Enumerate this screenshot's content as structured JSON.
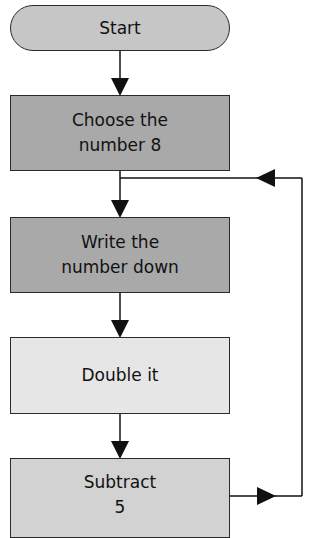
{
  "flowchart": {
    "nodes": [
      {
        "id": "start",
        "shape": "terminal",
        "lines": [
          "Start"
        ],
        "fill": "#c6c6c6"
      },
      {
        "id": "choose",
        "shape": "process",
        "lines": [
          "Choose the",
          "number 8"
        ],
        "fill": "#a9a9a9"
      },
      {
        "id": "write",
        "shape": "process",
        "lines": [
          "Write the",
          "number down"
        ],
        "fill": "#a9a9a9"
      },
      {
        "id": "double",
        "shape": "process",
        "lines": [
          "Double it"
        ],
        "fill": "#e6e6e6"
      },
      {
        "id": "subtract",
        "shape": "process",
        "lines": [
          "Subtract",
          "5"
        ],
        "fill": "#d2d2d2"
      }
    ],
    "edges": [
      {
        "from": "start",
        "to": "choose"
      },
      {
        "from": "choose",
        "to": "write"
      },
      {
        "from": "write",
        "to": "double"
      },
      {
        "from": "double",
        "to": "subtract"
      },
      {
        "from": "subtract",
        "to": "write",
        "type": "loop-back"
      }
    ],
    "colors": {
      "line": "#111111",
      "border": "#2a2a2a"
    }
  }
}
